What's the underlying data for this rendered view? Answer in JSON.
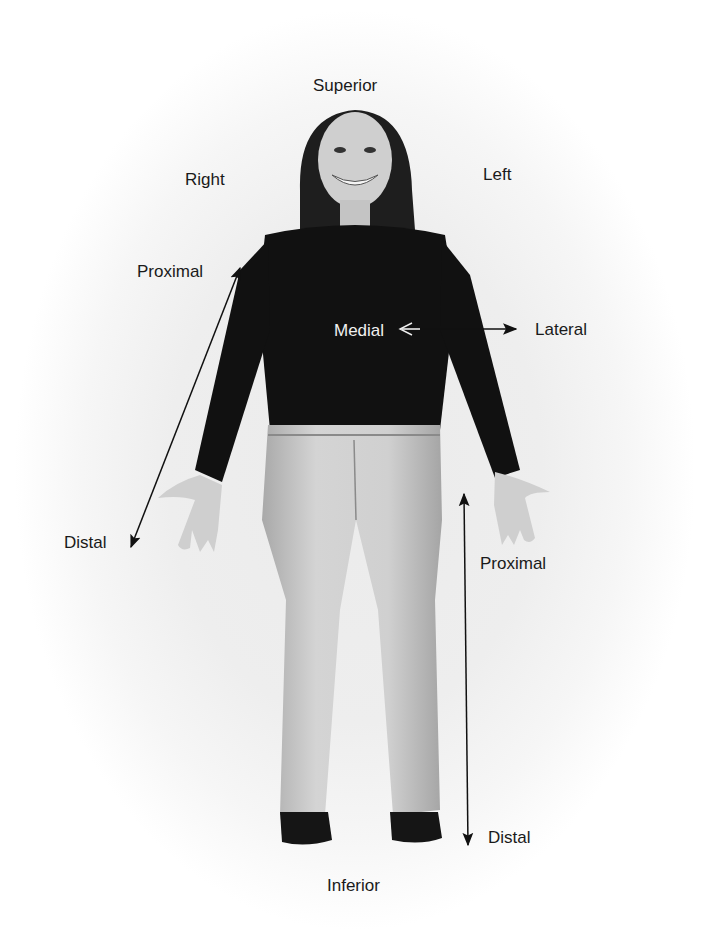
{
  "diagram": {
    "labels": {
      "superior": "Superior",
      "inferior": "Inferior",
      "right": "Right",
      "left": "Left",
      "medial": "Medial",
      "lateral": "Lateral",
      "arm_proximal": "Proximal",
      "arm_distal": "Distal",
      "leg_proximal": "Proximal",
      "leg_distal": "Distal"
    },
    "arrows": [
      {
        "name": "medial-lateral-arrow",
        "from": "Medial",
        "to": "Lateral",
        "style": "double-headed, open head at medial end"
      },
      {
        "name": "arm-proximal-distal-arrow",
        "from": "Proximal",
        "to": "Distal",
        "style": "double-headed, diagonal along right arm"
      },
      {
        "name": "leg-proximal-distal-arrow",
        "from": "Proximal",
        "to": "Distal",
        "style": "double-headed, vertical along left leg"
      }
    ],
    "colors": {
      "background": "#eeeeee",
      "shirt": "#111111",
      "jeans": "#c9c9c9",
      "skin": "#cfcfcf",
      "hair": "#1e1e1e",
      "text": "#1a1a1a",
      "text_on_dark": "#f0f0f0"
    }
  }
}
